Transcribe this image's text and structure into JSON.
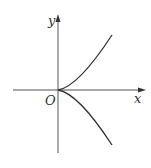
{
  "diagram": {
    "type": "function-graph",
    "axes": {
      "x_label": "x",
      "y_label": "y",
      "origin_label": "O"
    },
    "curves": [
      {
        "name": "upper-branch",
        "path": "M58,90 Q78,87 112,35"
      },
      {
        "name": "lower-branch",
        "path": "M58,90 Q78,93 112,145"
      }
    ],
    "colors": {
      "axis": "#555555",
      "curve": "#333333",
      "text": "#333333"
    }
  }
}
